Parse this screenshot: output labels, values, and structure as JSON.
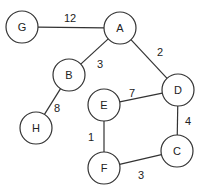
{
  "graph": {
    "nodes": [
      {
        "id": "G",
        "label": "G",
        "x": 22,
        "y": 27
      },
      {
        "id": "A",
        "label": "A",
        "x": 120,
        "y": 28
      },
      {
        "id": "B",
        "label": "B",
        "x": 69,
        "y": 75
      },
      {
        "id": "D",
        "label": "D",
        "x": 178,
        "y": 90
      },
      {
        "id": "E",
        "label": "E",
        "x": 104,
        "y": 105
      },
      {
        "id": "H",
        "label": "H",
        "x": 36,
        "y": 128
      },
      {
        "id": "C",
        "label": "C",
        "x": 177,
        "y": 151
      },
      {
        "id": "F",
        "label": "F",
        "x": 104,
        "y": 168
      }
    ],
    "edges": [
      {
        "from": "G",
        "to": "A",
        "weight": "12",
        "lx": 70,
        "ly": 18
      },
      {
        "from": "A",
        "to": "B",
        "weight": "3",
        "lx": 100,
        "ly": 64
      },
      {
        "from": "A",
        "to": "D",
        "weight": "2",
        "lx": 160,
        "ly": 52
      },
      {
        "from": "B",
        "to": "H",
        "weight": "8",
        "lx": 57,
        "ly": 108
      },
      {
        "from": "E",
        "to": "D",
        "weight": "7",
        "lx": 132,
        "ly": 93
      },
      {
        "from": "D",
        "to": "C",
        "weight": "4",
        "lx": 188,
        "ly": 121
      },
      {
        "from": "E",
        "to": "F",
        "weight": "1",
        "lx": 91,
        "ly": 137
      },
      {
        "from": "F",
        "to": "C",
        "weight": "3",
        "lx": 141,
        "ly": 175
      }
    ]
  }
}
